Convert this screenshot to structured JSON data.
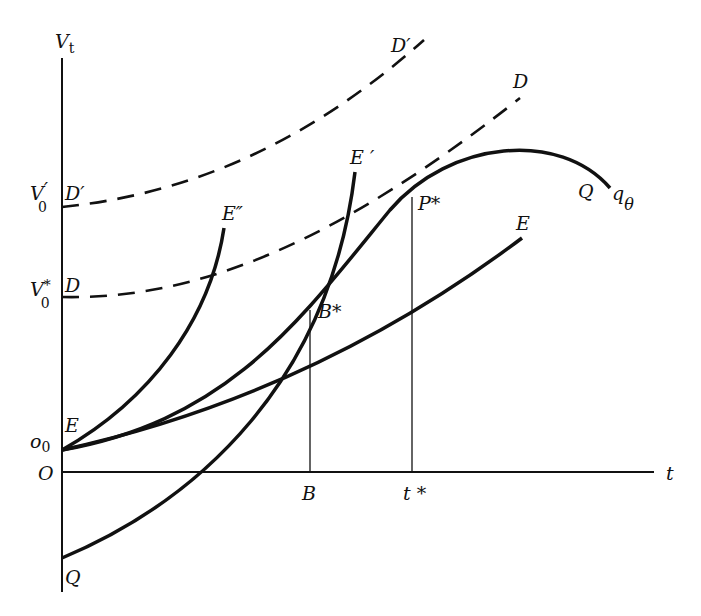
{
  "diagram": {
    "axes": {
      "y_label": "V",
      "y_label_sub": "t",
      "x_label": "t",
      "origin_label": "O"
    },
    "y_axis_labels": {
      "v0_prime": "V",
      "v0_prime_sub": "0",
      "v0_prime_mark": "′",
      "v0_star": "V",
      "v0_star_sub": "0",
      "v0_star_mark": "*",
      "o0": "o",
      "o0_sub": "0"
    },
    "x_axis_labels": {
      "b": "B",
      "t_star": "t *"
    },
    "curve_labels": {
      "d_prime_start": "D′",
      "d_prime_end": "D′",
      "d_start": "D",
      "d_end": "D",
      "e_start": "E",
      "e_end": "E",
      "e_prime": "E ′",
      "e_double_prime": "E″",
      "q_start": "Q",
      "q_end": "Q",
      "q_theta": "q",
      "q_theta_sub": "θ",
      "b_star": "B*",
      "p_star": "P*"
    }
  }
}
